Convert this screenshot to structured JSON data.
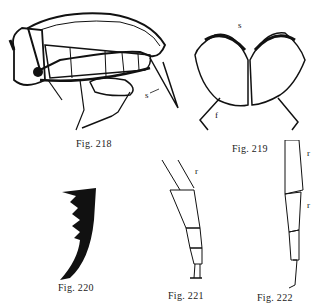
{
  "figures": [
    {
      "id": "218",
      "caption": "Fig. 218",
      "labels": [
        "s"
      ],
      "subject": "insect-lateral-view"
    },
    {
      "id": "219",
      "caption": "Fig. 219",
      "labels": [
        "s",
        "f"
      ],
      "subject": "paired-wing-covers"
    },
    {
      "id": "220",
      "caption": "Fig. 220",
      "labels": [],
      "subject": "toothed-claw"
    },
    {
      "id": "221",
      "caption": "Fig. 221",
      "labels": [
        "r"
      ],
      "subject": "segmented-leg"
    },
    {
      "id": "222",
      "caption": "Fig. 222",
      "labels": [
        "r",
        "r"
      ],
      "subject": "segmented-leg"
    }
  ],
  "colors": {
    "ink": "#111111",
    "paper": "#ffffff"
  }
}
